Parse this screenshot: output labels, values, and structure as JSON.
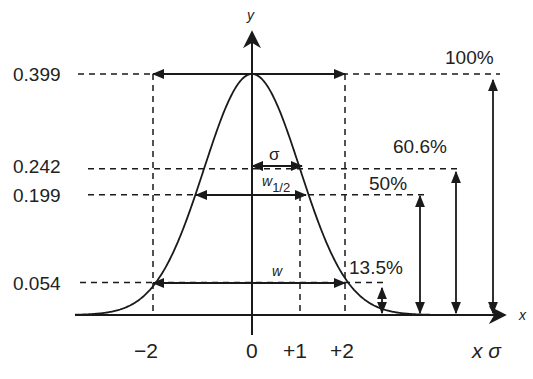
{
  "diagram": {
    "title": "",
    "axes": {
      "x_label": "x",
      "y_label": "y",
      "x_unit_label": "x σ"
    },
    "x_ticks": [
      {
        "value": -2,
        "label": "−2"
      },
      {
        "value": 0,
        "label": "0"
      },
      {
        "value": 1,
        "label": "+1"
      },
      {
        "value": 2,
        "label": "+2"
      }
    ],
    "y_levels": [
      {
        "value": 0.399,
        "label": "0.399",
        "percent_label": "100%"
      },
      {
        "value": 0.242,
        "label": "0.242",
        "percent_label": "60.6%"
      },
      {
        "value": 0.199,
        "label": "0.199",
        "percent_label": "50%"
      },
      {
        "value": 0.054,
        "label": "0.054",
        "percent_label": "13.5%"
      }
    ],
    "width_annotations": {
      "sigma": "σ",
      "half_width": "w",
      "half_width_sub": "1/2",
      "full_width": "w"
    },
    "curve": {
      "type": "gaussian",
      "mean": 0,
      "sigma": 1,
      "peak": 0.399
    }
  }
}
